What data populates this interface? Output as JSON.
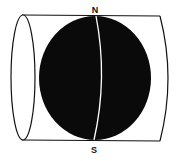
{
  "diagram": {
    "labels": {
      "north": "N",
      "south": "S"
    },
    "colors": {
      "globe": "#0a0a0a",
      "outline": "#111111",
      "meridian": "#ffffff",
      "background": "#ffffff"
    }
  }
}
